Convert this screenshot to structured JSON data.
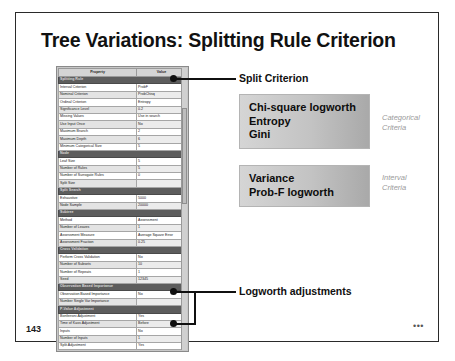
{
  "slide": {
    "title": "Tree Variations: Splitting Rule Criterion",
    "number": "143",
    "corner_dots": "•••"
  },
  "property_sheet": {
    "columns": [
      "Property",
      "Value"
    ],
    "rows": [
      {
        "type": "section",
        "property": "Splitting Rule",
        "value": ""
      },
      {
        "type": "row",
        "property": "Interval Criterion",
        "value": "ProbF"
      },
      {
        "type": "row",
        "property": "Nominal Criterion",
        "value": "ProbChisq"
      },
      {
        "type": "row",
        "property": "Ordinal Criterion",
        "value": "Entropy"
      },
      {
        "type": "row",
        "property": "Significance Level",
        "value": "0.2"
      },
      {
        "type": "row",
        "property": "Missing Values",
        "value": "Use in search"
      },
      {
        "type": "row",
        "property": "Use Input Once",
        "value": "No"
      },
      {
        "type": "row",
        "property": "Maximum Branch",
        "value": "2"
      },
      {
        "type": "row",
        "property": "Maximum Depth",
        "value": "6"
      },
      {
        "type": "row",
        "property": "Minimum Categorical Size",
        "value": "5"
      },
      {
        "type": "section",
        "property": "Node",
        "value": ""
      },
      {
        "type": "row",
        "property": "Leaf Size",
        "value": "5"
      },
      {
        "type": "row",
        "property": "Number of Rules",
        "value": "5"
      },
      {
        "type": "row",
        "property": "Number of Surrogate Rules",
        "value": "0"
      },
      {
        "type": "row",
        "property": "Split Size",
        "value": ""
      },
      {
        "type": "section",
        "property": "Split Search",
        "value": ""
      },
      {
        "type": "row",
        "property": "Exhaustive",
        "value": "5000"
      },
      {
        "type": "row",
        "property": "Node Sample",
        "value": "20000"
      },
      {
        "type": "section",
        "property": "Subtree",
        "value": ""
      },
      {
        "type": "row",
        "property": "Method",
        "value": "Assessment"
      },
      {
        "type": "row",
        "property": "Number of Leaves",
        "value": "1"
      },
      {
        "type": "row",
        "property": "Assessment Measure",
        "value": "Average Square Error"
      },
      {
        "type": "row",
        "property": "Assessment Fraction",
        "value": "0.25"
      },
      {
        "type": "section",
        "property": "Cross Validation",
        "value": ""
      },
      {
        "type": "row",
        "property": "Perform Cross Validation",
        "value": "No"
      },
      {
        "type": "row",
        "property": "Number of Subsets",
        "value": "10"
      },
      {
        "type": "row",
        "property": "Number of Repeats",
        "value": "1"
      },
      {
        "type": "row",
        "property": "Seed",
        "value": "12345"
      },
      {
        "type": "section",
        "property": "Observation Based Importance",
        "value": ""
      },
      {
        "type": "row",
        "property": "Observation Based Importance",
        "value": "No"
      },
      {
        "type": "row",
        "property": "Number Single Var Importance",
        "value": ""
      },
      {
        "type": "section",
        "property": "P-Value Adjustment",
        "value": ""
      },
      {
        "type": "row",
        "property": "Bonferroni Adjustment",
        "value": "Yes"
      },
      {
        "type": "row",
        "property": "Time of Kass Adjustment",
        "value": "Before"
      },
      {
        "type": "row",
        "property": "Inputs",
        "value": "No"
      },
      {
        "type": "row",
        "property": "Number of Inputs",
        "value": "1"
      },
      {
        "type": "row",
        "property": "Split Adjustment",
        "value": "Yes"
      }
    ]
  },
  "callouts": {
    "split_criterion": "Split Criterion",
    "logworth_adjustments": "Logworth adjustments"
  },
  "criteria_boxes": [
    {
      "lines": [
        "Chi-square logworth",
        "Entropy",
        "Gini"
      ],
      "caption": [
        "Categorical",
        "Criteria"
      ]
    },
    {
      "lines": [
        "Variance",
        "Prob-F logworth"
      ],
      "caption": [
        "Interval",
        "Criteria"
      ]
    }
  ]
}
